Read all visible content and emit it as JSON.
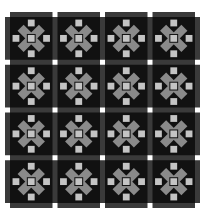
{
  "quilt": {
    "rows": 4,
    "cols": 4,
    "block_size": 48.5,
    "sashing_width": 5,
    "colors": {
      "background": "#ffffff",
      "sashing": "#3a3a3a",
      "cornerstone": "#ffffff",
      "block_bg": "#111111",
      "arms": "#8a8a8a",
      "squares": "#c4c4c4"
    }
  }
}
